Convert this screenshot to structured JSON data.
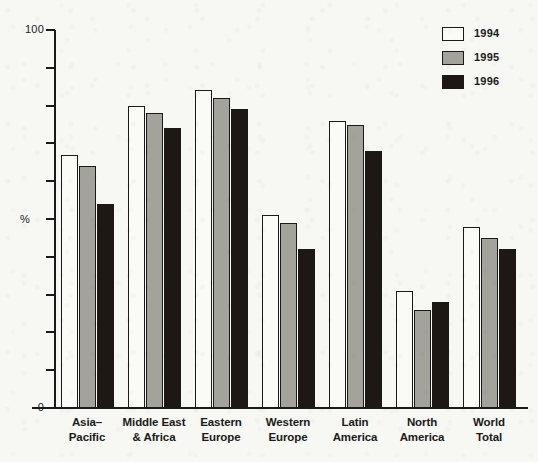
{
  "chart_data": {
    "type": "bar",
    "title": "",
    "subtitle": "",
    "xlabel": "",
    "ylabel": "%",
    "ylim": [
      0,
      100
    ],
    "y_tick_values": [
      0,
      10,
      20,
      30,
      40,
      50,
      60,
      70,
      80,
      90,
      100
    ],
    "y_tick_labels": [
      "0",
      "",
      "",
      "",
      "",
      "",
      "",
      "",
      "",
      "",
      "100"
    ],
    "grid": false,
    "legend_position": "top-right",
    "categories": [
      "Asia–Pacific",
      "Middle East & Africa",
      "Eastern Europe",
      "Western Europe",
      "Latin America",
      "North America",
      "World Total"
    ],
    "category_lines": [
      [
        "Asia–",
        "Pacific"
      ],
      [
        "Middle East",
        "& Africa"
      ],
      [
        "Eastern",
        "Europe"
      ],
      [
        "Western",
        "Europe"
      ],
      [
        "Latin",
        "America"
      ],
      [
        "North",
        "America"
      ],
      [
        "World",
        "Total"
      ]
    ],
    "series": [
      {
        "name": "1994",
        "color": "#fafaf7",
        "values": [
          67,
          80,
          84,
          51,
          76,
          31,
          48
        ]
      },
      {
        "name": "1995",
        "color": "#a3a39c",
        "values": [
          64,
          78,
          82,
          49,
          75,
          26,
          45
        ]
      },
      {
        "name": "1996",
        "color": "#1d1814",
        "values": [
          54,
          74,
          79,
          42,
          68,
          28,
          42
        ]
      }
    ]
  },
  "legend": {
    "entries": [
      {
        "label": "1994",
        "swatch": "white-square-swatch"
      },
      {
        "label": "1995",
        "swatch": "gray-square-swatch"
      },
      {
        "label": "1996",
        "swatch": "black-square-swatch"
      }
    ]
  },
  "axis": {
    "y_top_label": "100",
    "y_bottom_label": "0",
    "y_title": "%"
  },
  "colors": {
    "background": "#f7f7f4",
    "ink": "#1a1a1a",
    "series_1994": "#fafaf7",
    "series_1995": "#a3a39c",
    "series_1996": "#1d1814"
  }
}
